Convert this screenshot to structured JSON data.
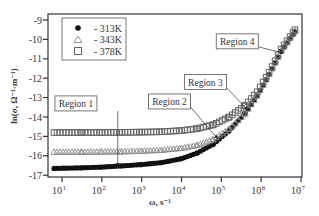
{
  "chart_data": {
    "type": "scatter",
    "title": "",
    "xlabel": "ω, s⁻¹",
    "ylabel": "ln(σ, Ω⁻¹·m⁻¹)",
    "xscale": "log",
    "xlim_log10": [
      0.65,
      7.0
    ],
    "ylim": [
      -17.1,
      -8.9
    ],
    "x_ticks": [
      {
        "exp": 1,
        "label": "10",
        "sup": "1"
      },
      {
        "exp": 2,
        "label": "10",
        "sup": "2"
      },
      {
        "exp": 3,
        "label": "10",
        "sup": "3"
      },
      {
        "exp": 4,
        "label": "10",
        "sup": "4"
      },
      {
        "exp": 5,
        "label": "10",
        "sup": "5"
      },
      {
        "exp": 6,
        "label": "10",
        "sup": "6"
      },
      {
        "exp": 7,
        "label": "10",
        "sup": "7"
      }
    ],
    "y_ticks": [
      -9,
      -10,
      -11,
      -12,
      -13,
      -14,
      -15,
      -16,
      -17
    ],
    "grid": false,
    "legend_position": "upper-left",
    "series": [
      {
        "name": "- 313K",
        "marker": "filled-circle",
        "log10_x": [
          0.8,
          1.5,
          2.0,
          2.5,
          3.0,
          3.5,
          4.0,
          4.4,
          4.8,
          5.2,
          5.6,
          5.9,
          6.2,
          6.5,
          6.85
        ],
        "y": [
          -16.65,
          -16.62,
          -16.58,
          -16.52,
          -16.45,
          -16.35,
          -16.15,
          -15.85,
          -15.4,
          -14.7,
          -13.8,
          -12.9,
          -11.8,
          -10.6,
          -9.6
        ]
      },
      {
        "name": "- 343K",
        "marker": "open-triangle",
        "log10_x": [
          0.8,
          1.5,
          2.0,
          2.5,
          3.0,
          3.5,
          4.0,
          4.4,
          4.8,
          5.2,
          5.6,
          5.9,
          6.2,
          6.5,
          6.85
        ],
        "y": [
          -15.8,
          -15.8,
          -15.79,
          -15.78,
          -15.75,
          -15.7,
          -15.6,
          -15.45,
          -15.15,
          -14.6,
          -13.8,
          -12.9,
          -11.8,
          -10.6,
          -9.55
        ]
      },
      {
        "name": "- 378K",
        "marker": "open-square",
        "log10_x": [
          0.8,
          1.5,
          2.0,
          2.5,
          3.0,
          3.5,
          4.0,
          4.4,
          4.8,
          5.2,
          5.6,
          5.9,
          6.2,
          6.5,
          6.85
        ],
        "y": [
          -14.8,
          -14.8,
          -14.8,
          -14.79,
          -14.78,
          -14.76,
          -14.7,
          -14.6,
          -14.4,
          -14.0,
          -13.4,
          -12.7,
          -11.7,
          -10.5,
          -9.5
        ]
      }
    ],
    "annotations": [
      {
        "text": "Region 1",
        "box_log10_x": 1.35,
        "box_y": -13.3,
        "arrow_to_log10_x": 2.4,
        "arrow_to_y": -16.5
      },
      {
        "text": "Region 2",
        "box_log10_x": 3.7,
        "box_y": -13.2,
        "arrow_to_log10_x": 4.9,
        "arrow_to_y": -15.1
      },
      {
        "text": "Region 3",
        "box_log10_x": 4.6,
        "box_y": -12.2,
        "arrow_to_log10_x": 5.65,
        "arrow_to_y": -13.6
      },
      {
        "text": "Region 4",
        "box_log10_x": 5.4,
        "box_y": -10.1,
        "arrow_to_log10_x": 6.55,
        "arrow_to_y": -10.7
      }
    ]
  },
  "colors": {
    "frame": "#333333",
    "marker_313K": "#111111",
    "marker_343K": "#8a8a8a",
    "marker_378K": "#666666",
    "background": "#ffffff"
  }
}
